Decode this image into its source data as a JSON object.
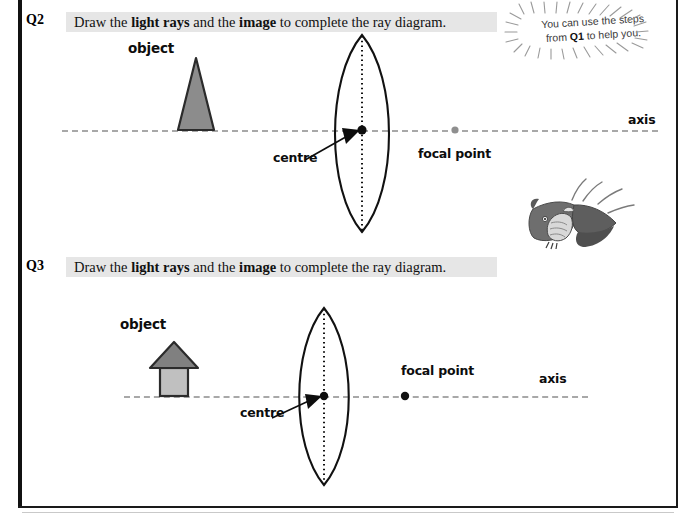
{
  "page": {
    "frame_color": "#111111",
    "background": "#ffffff"
  },
  "questions": [
    {
      "number": "Q2",
      "text_plain": "Draw the light rays and the image to complete the ray diagram.",
      "text_parts": [
        {
          "t": "Draw the ",
          "bold": false
        },
        {
          "t": "light rays",
          "bold": true
        },
        {
          "t": " and the ",
          "bold": false
        },
        {
          "t": "image",
          "bold": true
        },
        {
          "t": " to complete the ray diagram.",
          "bold": false
        }
      ],
      "diagram": {
        "object_label": "object",
        "object_shape": "triangle",
        "object_fill": "#8c8c8c",
        "centre_label": "centre",
        "focal_point_label": "focal point",
        "focal_point_color": "#8f8f8f",
        "axis_label": "axis",
        "axis_color": "#a8a8a8",
        "lens_type": "biconvex"
      }
    },
    {
      "number": "Q3",
      "text_plain": "Draw the light rays and the image to complete the ray diagram.",
      "text_parts": [
        {
          "t": "Draw the ",
          "bold": false
        },
        {
          "t": "light rays",
          "bold": true
        },
        {
          "t": " and the ",
          "bold": false
        },
        {
          "t": "image",
          "bold": true
        },
        {
          "t": " to complete the ray diagram.",
          "bold": false
        }
      ],
      "diagram": {
        "object_label": "object",
        "object_shape": "house-arrow",
        "object_fill_roof": "#808080",
        "object_fill_body": "#c0c0c0",
        "centre_label": "centre",
        "focal_point_label": "focal point",
        "focal_point_color": "#111111",
        "axis_label": "axis",
        "axis_color": "#a8a8a8",
        "lens_type": "biconvex"
      }
    }
  ],
  "hint": {
    "line1_pre": "You can use the steps",
    "line2_pre": "from ",
    "line2_bold": "Q1",
    "line2_post": " to help you."
  },
  "mascot": {
    "name": "flying-bat-cartoon",
    "description": "grayscale cartoon bat in flight with motion lines"
  }
}
